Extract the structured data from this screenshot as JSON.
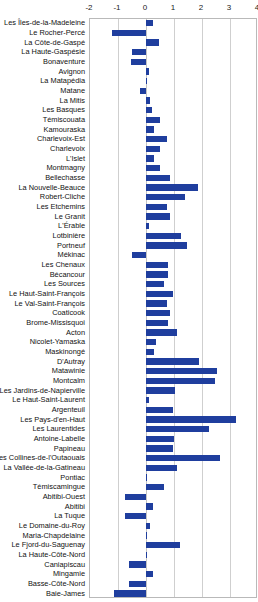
{
  "chart_data": {
    "type": "bar",
    "orientation": "horizontal",
    "title": "",
    "subtitle": "",
    "xlabel": "",
    "ylabel": "",
    "xlim": [
      -2,
      4
    ],
    "xticks": [
      -2,
      -1,
      0,
      1,
      2,
      3,
      4
    ],
    "xtick_labels": [
      "-2",
      "-1",
      "0",
      "1",
      "2",
      "3",
      "4"
    ],
    "grid": true,
    "legend": "none",
    "bar_color": "#1f3e9e",
    "categories": [
      "Les Îles-de-la-Madeleine",
      "Le Rocher-Percé",
      "La Côte-de-Gaspé",
      "La Haute-Gaspésie",
      "Bonaventure",
      "Avignon",
      "La Matapédia",
      "Matane",
      "La Mitis",
      "Les Basques",
      "Témiscouata",
      "Kamouraska",
      "Charlevoix-Est",
      "Charlevoix",
      "L'Islet",
      "Montmagny",
      "Bellechasse",
      "La Nouvelle-Beauce",
      "Robert-Cliche",
      "Les Etchemins",
      "Le Granit",
      "L'Érable",
      "Lotbinière",
      "Portneuf",
      "Mékinac",
      "Les Chenaux",
      "Bécancour",
      "Les Sources",
      "Le Haut-Saint-François",
      "Le Val-Saint-François",
      "Coaticook",
      "Brome-Missisquoi",
      "Acton",
      "Nicolet-Yamaska",
      "Maskinongé",
      "D'Autray",
      "Matawinie",
      "Montcalm",
      "Les Jardins-de-Napierville",
      "Le Haut-Saint-Laurent",
      "Argenteuil",
      "Les Pays-d'en-Haut",
      "Les Laurentides",
      "Antoine-Labelle",
      "Papineau",
      "Les Collines-de-l'Outaouais",
      "La Vallée-de-la-Gatineau",
      "Pontiac",
      "Témiscamingue",
      "Abitibi-Ouest",
      "Abitibi",
      "La Tuque",
      "Le Domaine-du-Roy",
      "Maria-Chapdelaine",
      "Le Fjord-du-Saguenay",
      "La Haute-Côte-Nord",
      "Caniapiscau",
      "Mingamie",
      "Basse-Côte-Nord",
      "Baie-James"
    ],
    "values": [
      0.25,
      -1.2,
      0.45,
      -0.5,
      -0.55,
      0.12,
      0.02,
      -0.2,
      0.15,
      0.2,
      0.5,
      0.3,
      0.75,
      0.5,
      0.3,
      0.5,
      0.85,
      1.85,
      1.4,
      0.75,
      0.85,
      0.12,
      1.25,
      1.45,
      -0.5,
      0.8,
      0.8,
      0.65,
      0.95,
      0.75,
      0.85,
      0.8,
      1.1,
      0.35,
      0.3,
      1.9,
      2.55,
      2.45,
      1.05,
      0.1,
      0.95,
      3.2,
      2.25,
      1.0,
      0.95,
      2.65,
      1.1,
      0.0,
      0.65,
      -0.75,
      0.25,
      -0.75,
      0.15,
      0.0,
      1.2,
      0.0,
      -0.6,
      0.25,
      -0.6,
      -1.15
    ]
  }
}
